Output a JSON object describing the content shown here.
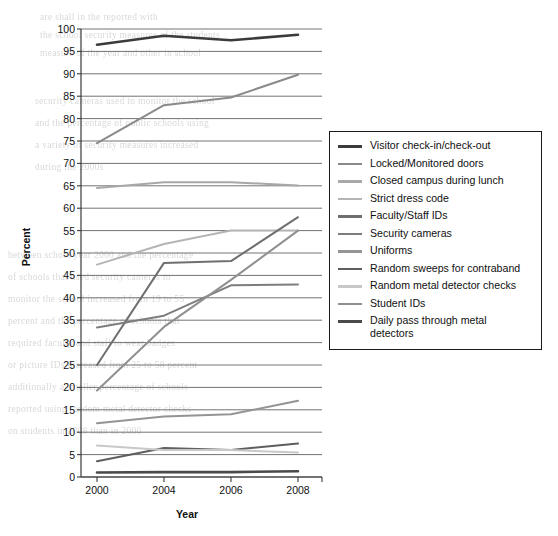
{
  "chart_data": {
    "type": "line",
    "title": "",
    "xlabel": "Year",
    "ylabel": "Percent",
    "categories": [
      "2000",
      "2004",
      "2006",
      "2008"
    ],
    "x": [
      2000,
      2004,
      2006,
      2008
    ],
    "ylim": [
      0,
      100
    ],
    "ytick_step": 5,
    "yticks": [
      0,
      5,
      10,
      15,
      20,
      25,
      30,
      35,
      40,
      45,
      50,
      55,
      60,
      65,
      70,
      75,
      80,
      85,
      90,
      95,
      100
    ],
    "grid": "horizontal",
    "legend_position": "right",
    "series": [
      {
        "name": "Visitor check-in/check-out",
        "values": [
          96.5,
          98.5,
          97.5,
          98.7
        ],
        "color": "#3b3b3b"
      },
      {
        "name": "Locked/Monitored doors",
        "values": [
          74.5,
          83.0,
          84.7,
          89.8
        ],
        "color": "#8a8a8a"
      },
      {
        "name": "Closed campus during lunch",
        "values": [
          64.5,
          65.8,
          65.8,
          65.1
        ],
        "color": "#a8a8a8"
      },
      {
        "name": "Strict dress code",
        "values": [
          47.4,
          52.0,
          55.0,
          55.0
        ],
        "color": "#b5b5b5"
      },
      {
        "name": "Faculty/Staff IDs",
        "values": [
          25.0,
          47.8,
          48.2,
          58.0
        ],
        "color": "#6f6f6f"
      },
      {
        "name": "Security cameras",
        "values": [
          33.4,
          36.0,
          42.8,
          43.0
        ],
        "color": "#7d7d7d"
      },
      {
        "name": "Uniforms",
        "values": [
          12.0,
          13.5,
          14.0,
          17.0
        ],
        "color": "#949494"
      },
      {
        "name": "Random sweeps for contraband",
        "values": [
          3.5,
          6.5,
          6.0,
          7.5
        ],
        "color": "#5e5e5e"
      },
      {
        "name": "Random metal detector checks",
        "values": [
          7.0,
          6.0,
          6.0,
          5.5
        ],
        "color": "#c8c8c8"
      },
      {
        "name": "Student IDs",
        "values": [
          19.3,
          33.5,
          44.0,
          55.0
        ],
        "color": "#8f8f8f"
      },
      {
        "name": "Daily pass through metal detectors",
        "values": [
          1.0,
          1.1,
          1.1,
          1.3
        ],
        "color": "#4a4a4a"
      }
    ]
  },
  "legend": {
    "items": [
      {
        "label": "Visitor check-in/check-out"
      },
      {
        "label": "Locked/Monitored doors"
      },
      {
        "label": "Closed campus during lunch"
      },
      {
        "label": "Strict dress code"
      },
      {
        "label": "Faculty/Staff IDs"
      },
      {
        "label": "Security cameras"
      },
      {
        "label": "Uniforms"
      },
      {
        "label": "Random sweeps for contraband"
      },
      {
        "label": "Random metal detector checks"
      },
      {
        "label": "Student IDs"
      },
      {
        "label": "Daily pass through metal detectors"
      }
    ]
  },
  "page_bleed_text": [
    "are  shall  in  the  reported  with",
    "the  school  security  measures  of  the  students",
    "measure  of  the  year  and  other  in  school",
    "security  cameras  used  to  monitor  the  school",
    "and  the  percentage  of  public  schools  using",
    "a  variety  of  security  measures  increased",
    "during  the  2000s",
    "between  school  year  2000  and  the  percentage",
    "of  schools  that  used  security  cameras  to",
    "monitor  the  school  increased  from  19  to  55",
    "percent  and  the  percentage  of  schools  that",
    "required  faculty  and  staff  to  wear  badges",
    "or  picture  IDs  increased  from  25  to  58  percent",
    "additionally  a  smaller  percentage  of  schools",
    "reported  using  random  metal  detector  checks",
    "on  students  in  2008  than  in  2000"
  ]
}
